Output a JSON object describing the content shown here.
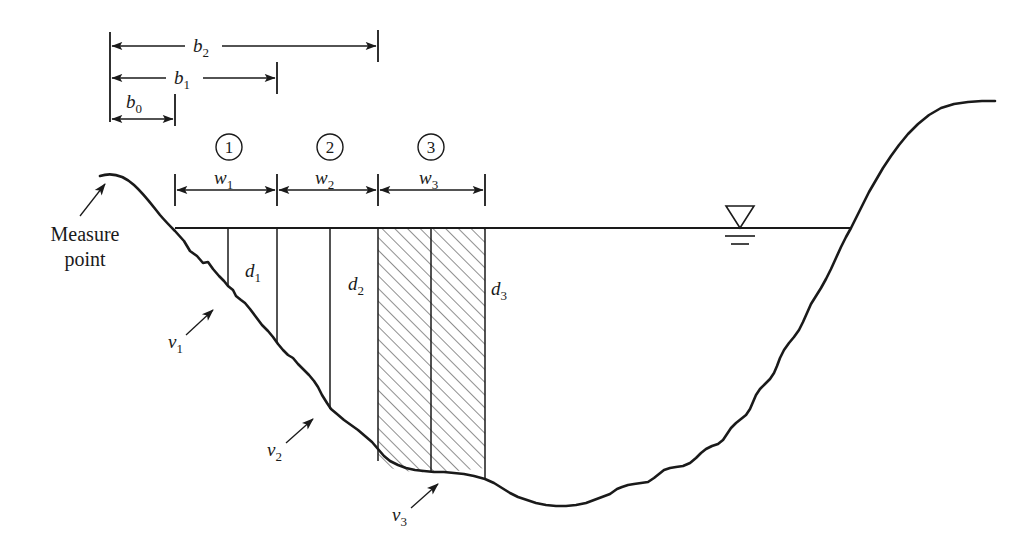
{
  "figure": {
    "type": "cross-section-diagram",
    "background_color": "#ffffff",
    "line_color": "#1a1a1a"
  },
  "annotations": {
    "measure_point": {
      "line1": "Measure",
      "line2": "point"
    }
  },
  "distance_dimensions": [
    {
      "id": "b2",
      "base": "b",
      "sub": "2",
      "x_start": 110,
      "x_end": 378,
      "y": 46
    },
    {
      "id": "b1",
      "base": "b",
      "sub": "1",
      "x_start": 110,
      "x_end": 277,
      "y": 78
    },
    {
      "id": "b0",
      "base": "b",
      "sub": "0",
      "x_start": 110,
      "x_end": 175,
      "y": 110
    }
  ],
  "width_dimensions": [
    {
      "id": "w1",
      "base": "w",
      "sub": "1",
      "x_start": 175,
      "x_end": 277,
      "y": 190
    },
    {
      "id": "w2",
      "base": "w",
      "sub": "2",
      "x_start": 277,
      "x_end": 378,
      "y": 190
    },
    {
      "id": "w3",
      "base": "w",
      "sub": "3",
      "x_start": 378,
      "x_end": 485,
      "y": 190
    }
  ],
  "panels": [
    {
      "number": "1",
      "cx": 229,
      "cy": 147
    },
    {
      "number": "2",
      "cx": 330,
      "cy": 147
    },
    {
      "number": "3",
      "cx": 431,
      "cy": 147
    }
  ],
  "depth_labels": [
    {
      "id": "d1",
      "base": "d",
      "sub": "1",
      "x": 245,
      "y": 277
    },
    {
      "id": "d2",
      "base": "d",
      "sub": "2",
      "x": 348,
      "y": 290
    },
    {
      "id": "d3",
      "base": "d",
      "sub": "3",
      "x": 491,
      "y": 295
    }
  ],
  "velocity_labels": [
    {
      "id": "v1",
      "base": "v",
      "sub": "1",
      "x": 172,
      "y": 344
    },
    {
      "id": "v2",
      "base": "v",
      "sub": "2",
      "x": 271,
      "y": 452
    },
    {
      "id": "v3",
      "base": "v",
      "sub": "3",
      "x": 396,
      "y": 518
    }
  ],
  "water_surface": {
    "y": 228,
    "x_left": 175,
    "x_right": 851,
    "symbol": "water-level-triangle",
    "symbol_x": 740
  },
  "vertical_section_lines_x": [
    228,
    277,
    330,
    378,
    431,
    485
  ],
  "hatched_region": {
    "x_start": 378,
    "x_end": 485,
    "hatch_angle_deg": 45
  }
}
